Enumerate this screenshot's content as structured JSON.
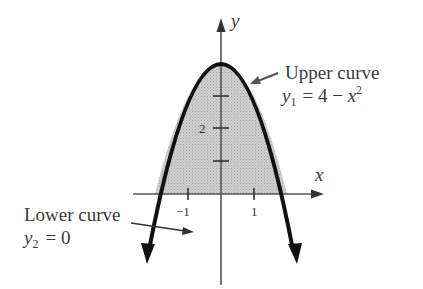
{
  "figure": {
    "axes": {
      "x_label": "x",
      "y_label": "y",
      "x_ticks": [
        {
          "value": -1,
          "label": "−1"
        },
        {
          "value": 1,
          "label": "1"
        }
      ],
      "y_ticks": [
        {
          "value": 1,
          "label": ""
        },
        {
          "value": 2,
          "label": "2"
        },
        {
          "value": 3,
          "label": ""
        }
      ]
    },
    "upper_curve": {
      "title": "Upper curve",
      "eq_lhs": "y",
      "eq_sub": "1",
      "eq_rhs_const": "= 4 − ",
      "eq_var": "x",
      "eq_exp": "2"
    },
    "lower_curve": {
      "title": "Lower curve",
      "eq_lhs": "y",
      "eq_sub": "2",
      "eq_rhs": "= 0"
    },
    "colors": {
      "curve": "#111111",
      "fill": "#c8c8c8",
      "axis": "#555555",
      "text": "#3a3a3a",
      "pointer": "#555555"
    }
  }
}
